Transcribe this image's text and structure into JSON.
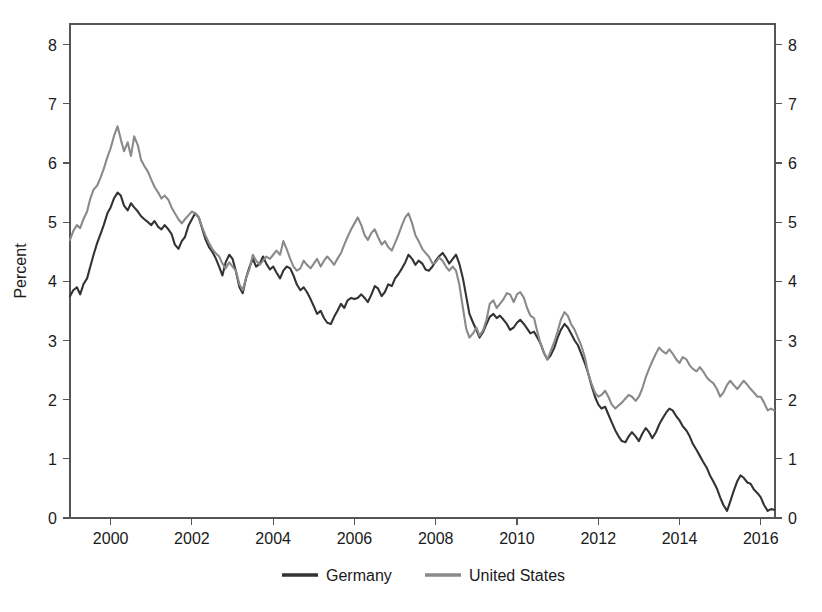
{
  "chart_data": {
    "type": "line",
    "title": "",
    "subtitle": "",
    "xlabel": "",
    "ylabel": "Percent",
    "ylabel_right": "",
    "xlim": [
      1999.0,
      2016.35
    ],
    "ylim": [
      0,
      8.35
    ],
    "grid": false,
    "legend_position": "bottom",
    "dual_y_axis": true,
    "x_ticks": [
      2000,
      2002,
      2004,
      2006,
      2008,
      2010,
      2012,
      2014,
      2016
    ],
    "x_tick_labels": [
      "2000",
      "2002",
      "2004",
      "2006",
      "2008",
      "2010",
      "2012",
      "2014",
      "2016"
    ],
    "y_ticks": [
      0,
      1,
      2,
      3,
      4,
      5,
      6,
      7,
      8
    ],
    "y_tick_labels": [
      "0",
      "1",
      "2",
      "3",
      "4",
      "5",
      "6",
      "7",
      "8"
    ],
    "y_ticks_right": [
      0,
      1,
      2,
      3,
      4,
      5,
      6,
      7,
      8
    ],
    "y_tick_labels_right": [
      "0",
      "1",
      "2",
      "3",
      "4",
      "5",
      "6",
      "7",
      "8"
    ],
    "colors": {
      "germany": "#333333",
      "united_states": "#8a8a8a",
      "axis": "#555555",
      "text": "#1a1a1a",
      "background": "#ffffff"
    },
    "series": [
      {
        "name": "Germany",
        "color": "#333333",
        "x": [
          1999.0,
          1999.08,
          1999.17,
          1999.25,
          1999.33,
          1999.42,
          1999.5,
          1999.58,
          1999.67,
          1999.75,
          1999.83,
          1999.92,
          2000.0,
          2000.08,
          2000.17,
          2000.25,
          2000.33,
          2000.42,
          2000.5,
          2000.58,
          2000.67,
          2000.75,
          2000.83,
          2000.92,
          2001.0,
          2001.08,
          2001.17,
          2001.25,
          2001.33,
          2001.42,
          2001.5,
          2001.58,
          2001.67,
          2001.75,
          2001.83,
          2001.92,
          2002.0,
          2002.08,
          2002.17,
          2002.25,
          2002.33,
          2002.42,
          2002.5,
          2002.58,
          2002.67,
          2002.75,
          2002.83,
          2002.92,
          2003.0,
          2003.08,
          2003.17,
          2003.25,
          2003.33,
          2003.42,
          2003.5,
          2003.58,
          2003.67,
          2003.75,
          2003.83,
          2003.92,
          2004.0,
          2004.08,
          2004.17,
          2004.25,
          2004.33,
          2004.42,
          2004.5,
          2004.58,
          2004.67,
          2004.75,
          2004.83,
          2004.92,
          2005.0,
          2005.08,
          2005.17,
          2005.25,
          2005.33,
          2005.42,
          2005.5,
          2005.58,
          2005.67,
          2005.75,
          2005.83,
          2005.92,
          2006.0,
          2006.08,
          2006.17,
          2006.25,
          2006.33,
          2006.42,
          2006.5,
          2006.58,
          2006.67,
          2006.75,
          2006.83,
          2006.92,
          2007.0,
          2007.08,
          2007.17,
          2007.25,
          2007.33,
          2007.42,
          2007.5,
          2007.58,
          2007.67,
          2007.75,
          2007.83,
          2007.92,
          2008.0,
          2008.08,
          2008.17,
          2008.25,
          2008.33,
          2008.42,
          2008.5,
          2008.58,
          2008.67,
          2008.75,
          2008.83,
          2008.92,
          2009.0,
          2009.08,
          2009.17,
          2009.25,
          2009.33,
          2009.42,
          2009.5,
          2009.58,
          2009.67,
          2009.75,
          2009.83,
          2009.92,
          2010.0,
          2010.08,
          2010.17,
          2010.25,
          2010.33,
          2010.42,
          2010.5,
          2010.58,
          2010.67,
          2010.75,
          2010.83,
          2010.92,
          2011.0,
          2011.08,
          2011.17,
          2011.25,
          2011.33,
          2011.42,
          2011.5,
          2011.58,
          2011.67,
          2011.75,
          2011.83,
          2011.92,
          2012.0,
          2012.08,
          2012.17,
          2012.25,
          2012.33,
          2012.42,
          2012.5,
          2012.58,
          2012.67,
          2012.75,
          2012.83,
          2012.92,
          2013.0,
          2013.08,
          2013.17,
          2013.25,
          2013.33,
          2013.42,
          2013.5,
          2013.58,
          2013.67,
          2013.75,
          2013.83,
          2013.92,
          2014.0,
          2014.08,
          2014.17,
          2014.25,
          2014.33,
          2014.42,
          2014.5,
          2014.58,
          2014.67,
          2014.75,
          2014.83,
          2014.92,
          2015.0,
          2015.08,
          2015.17,
          2015.25,
          2015.33,
          2015.42,
          2015.5,
          2015.58,
          2015.67,
          2015.75,
          2015.83,
          2015.92,
          2016.0,
          2016.08,
          2016.17,
          2016.25,
          2016.33
        ],
        "y": [
          3.75,
          3.85,
          3.9,
          3.78,
          3.95,
          4.05,
          4.25,
          4.45,
          4.65,
          4.8,
          4.95,
          5.15,
          5.25,
          5.4,
          5.5,
          5.45,
          5.28,
          5.2,
          5.32,
          5.25,
          5.18,
          5.1,
          5.05,
          5.0,
          4.95,
          5.02,
          4.92,
          4.88,
          4.95,
          4.88,
          4.8,
          4.62,
          4.55,
          4.68,
          4.75,
          4.95,
          5.05,
          5.15,
          5.08,
          4.9,
          4.72,
          4.58,
          4.5,
          4.4,
          4.25,
          4.1,
          4.32,
          4.45,
          4.38,
          4.18,
          3.9,
          3.8,
          4.05,
          4.25,
          4.38,
          4.25,
          4.3,
          4.42,
          4.3,
          4.2,
          4.25,
          4.15,
          4.05,
          4.18,
          4.25,
          4.22,
          4.1,
          3.95,
          3.85,
          3.9,
          3.82,
          3.7,
          3.58,
          3.45,
          3.5,
          3.38,
          3.3,
          3.28,
          3.4,
          3.5,
          3.62,
          3.55,
          3.68,
          3.72,
          3.7,
          3.72,
          3.78,
          3.72,
          3.65,
          3.78,
          3.92,
          3.88,
          3.75,
          3.82,
          3.95,
          3.92,
          4.05,
          4.12,
          4.22,
          4.32,
          4.45,
          4.38,
          4.28,
          4.35,
          4.3,
          4.2,
          4.18,
          4.25,
          4.35,
          4.42,
          4.48,
          4.4,
          4.3,
          4.38,
          4.45,
          4.3,
          4.05,
          3.75,
          3.45,
          3.3,
          3.18,
          3.05,
          3.15,
          3.28,
          3.4,
          3.45,
          3.38,
          3.42,
          3.35,
          3.28,
          3.18,
          3.22,
          3.3,
          3.35,
          3.28,
          3.2,
          3.12,
          3.15,
          3.05,
          2.95,
          2.78,
          2.68,
          2.75,
          2.88,
          3.05,
          3.18,
          3.28,
          3.22,
          3.12,
          3.0,
          2.92,
          2.78,
          2.62,
          2.45,
          2.25,
          2.05,
          1.92,
          1.85,
          1.88,
          1.75,
          1.62,
          1.48,
          1.38,
          1.3,
          1.28,
          1.38,
          1.45,
          1.38,
          1.3,
          1.42,
          1.52,
          1.45,
          1.35,
          1.45,
          1.58,
          1.68,
          1.78,
          1.85,
          1.82,
          1.72,
          1.65,
          1.55,
          1.48,
          1.38,
          1.25,
          1.15,
          1.05,
          0.95,
          0.85,
          0.72,
          0.62,
          0.5,
          0.35,
          0.22,
          0.12,
          0.28,
          0.45,
          0.62,
          0.72,
          0.68,
          0.6,
          0.58,
          0.48,
          0.42,
          0.35,
          0.22,
          0.12,
          0.15,
          0.14
        ]
      },
      {
        "name": "United States",
        "color": "#8a8a8a",
        "x": [
          1999.0,
          1999.08,
          1999.17,
          1999.25,
          1999.33,
          1999.42,
          1999.5,
          1999.58,
          1999.67,
          1999.75,
          1999.83,
          1999.92,
          2000.0,
          2000.08,
          2000.17,
          2000.25,
          2000.33,
          2000.42,
          2000.5,
          2000.58,
          2000.67,
          2000.75,
          2000.83,
          2000.92,
          2001.0,
          2001.08,
          2001.17,
          2001.25,
          2001.33,
          2001.42,
          2001.5,
          2001.58,
          2001.67,
          2001.75,
          2001.83,
          2001.92,
          2002.0,
          2002.08,
          2002.17,
          2002.25,
          2002.33,
          2002.42,
          2002.5,
          2002.58,
          2002.67,
          2002.75,
          2002.83,
          2002.92,
          2003.0,
          2003.08,
          2003.17,
          2003.25,
          2003.33,
          2003.42,
          2003.5,
          2003.58,
          2003.67,
          2003.75,
          2003.83,
          2003.92,
          2004.0,
          2004.08,
          2004.17,
          2004.25,
          2004.33,
          2004.42,
          2004.5,
          2004.58,
          2004.67,
          2004.75,
          2004.83,
          2004.92,
          2005.0,
          2005.08,
          2005.17,
          2005.25,
          2005.33,
          2005.42,
          2005.5,
          2005.58,
          2005.67,
          2005.75,
          2005.83,
          2005.92,
          2006.0,
          2006.08,
          2006.17,
          2006.25,
          2006.33,
          2006.42,
          2006.5,
          2006.58,
          2006.67,
          2006.75,
          2006.83,
          2006.92,
          2007.0,
          2007.08,
          2007.17,
          2007.25,
          2007.33,
          2007.42,
          2007.5,
          2007.58,
          2007.67,
          2007.75,
          2007.83,
          2007.92,
          2008.0,
          2008.08,
          2008.17,
          2008.25,
          2008.33,
          2008.42,
          2008.5,
          2008.58,
          2008.67,
          2008.75,
          2008.83,
          2008.92,
          2009.0,
          2009.08,
          2009.17,
          2009.25,
          2009.33,
          2009.42,
          2009.5,
          2009.58,
          2009.67,
          2009.75,
          2009.83,
          2009.92,
          2010.0,
          2010.08,
          2010.17,
          2010.25,
          2010.33,
          2010.42,
          2010.5,
          2010.58,
          2010.67,
          2010.75,
          2010.83,
          2010.92,
          2011.0,
          2011.08,
          2011.17,
          2011.25,
          2011.33,
          2011.42,
          2011.5,
          2011.58,
          2011.67,
          2011.75,
          2011.83,
          2011.92,
          2012.0,
          2012.08,
          2012.17,
          2012.25,
          2012.33,
          2012.42,
          2012.5,
          2012.58,
          2012.67,
          2012.75,
          2012.83,
          2012.92,
          2013.0,
          2013.08,
          2013.17,
          2013.25,
          2013.33,
          2013.42,
          2013.5,
          2013.58,
          2013.67,
          2013.75,
          2013.83,
          2013.92,
          2014.0,
          2014.08,
          2014.17,
          2014.25,
          2014.33,
          2014.42,
          2014.5,
          2014.58,
          2014.67,
          2014.75,
          2014.83,
          2014.92,
          2015.0,
          2015.08,
          2015.17,
          2015.25,
          2015.33,
          2015.42,
          2015.5,
          2015.58,
          2015.67,
          2015.75,
          2015.83,
          2015.92,
          2016.0,
          2016.08,
          2016.17,
          2016.25,
          2016.33
        ],
        "y": [
          4.7,
          4.85,
          4.95,
          4.9,
          5.05,
          5.18,
          5.4,
          5.55,
          5.62,
          5.75,
          5.9,
          6.1,
          6.25,
          6.45,
          6.62,
          6.4,
          6.2,
          6.35,
          6.12,
          6.45,
          6.3,
          6.05,
          5.95,
          5.85,
          5.72,
          5.6,
          5.5,
          5.4,
          5.45,
          5.38,
          5.25,
          5.15,
          5.05,
          4.98,
          5.05,
          5.12,
          5.18,
          5.15,
          5.08,
          4.92,
          4.78,
          4.65,
          4.55,
          4.48,
          4.42,
          4.3,
          4.22,
          4.32,
          4.25,
          4.18,
          3.95,
          3.85,
          4.05,
          4.22,
          4.45,
          4.35,
          4.28,
          4.35,
          4.42,
          4.38,
          4.45,
          4.52,
          4.45,
          4.68,
          4.55,
          4.38,
          4.25,
          4.18,
          4.22,
          4.35,
          4.28,
          4.22,
          4.3,
          4.38,
          4.25,
          4.35,
          4.42,
          4.35,
          4.28,
          4.38,
          4.48,
          4.62,
          4.75,
          4.88,
          4.98,
          5.08,
          4.95,
          4.78,
          4.7,
          4.82,
          4.88,
          4.75,
          4.62,
          4.68,
          4.58,
          4.52,
          4.65,
          4.78,
          4.95,
          5.08,
          5.15,
          4.98,
          4.78,
          4.68,
          4.55,
          4.48,
          4.42,
          4.3,
          4.32,
          4.4,
          4.35,
          4.25,
          4.18,
          4.25,
          4.18,
          3.95,
          3.55,
          3.2,
          3.05,
          3.12,
          3.22,
          3.08,
          3.18,
          3.35,
          3.62,
          3.68,
          3.55,
          3.62,
          3.7,
          3.8,
          3.78,
          3.65,
          3.78,
          3.82,
          3.72,
          3.55,
          3.42,
          3.38,
          3.15,
          2.95,
          2.78,
          2.68,
          2.82,
          2.98,
          3.15,
          3.35,
          3.48,
          3.42,
          3.28,
          3.18,
          3.05,
          2.92,
          2.72,
          2.45,
          2.28,
          2.12,
          2.05,
          2.08,
          2.15,
          2.05,
          1.92,
          1.85,
          1.9,
          1.95,
          2.02,
          2.08,
          2.05,
          1.98,
          2.05,
          2.18,
          2.38,
          2.52,
          2.65,
          2.78,
          2.88,
          2.82,
          2.78,
          2.85,
          2.78,
          2.68,
          2.62,
          2.72,
          2.68,
          2.58,
          2.52,
          2.48,
          2.55,
          2.48,
          2.38,
          2.32,
          2.28,
          2.18,
          2.05,
          2.12,
          2.25,
          2.32,
          2.25,
          2.18,
          2.25,
          2.32,
          2.25,
          2.18,
          2.12,
          2.05,
          2.05,
          1.95,
          1.82,
          1.85,
          1.82
        ]
      }
    ]
  },
  "legend": {
    "items": [
      {
        "label": "Germany",
        "color": "#333333"
      },
      {
        "label": "United States",
        "color": "#8a8a8a"
      }
    ]
  }
}
